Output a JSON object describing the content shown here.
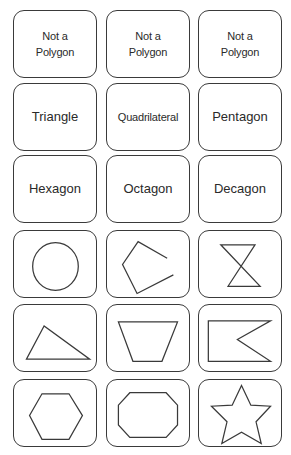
{
  "layout": {
    "columns_x": [
      13,
      106,
      198
    ],
    "rows_y": [
      10,
      83,
      155,
      230,
      304,
      379
    ],
    "card_width": 84,
    "card_height": 68
  },
  "colors": {
    "border": "#3a3a3a",
    "text": "#2a2a2a",
    "background": "#ffffff"
  },
  "name_cards": [
    {
      "id": "not-polygon-1",
      "label": "Not a\nPolygon"
    },
    {
      "id": "not-polygon-2",
      "label": "Not a\nPolygon"
    },
    {
      "id": "not-polygon-3",
      "label": "Not a\nPolygon"
    },
    {
      "id": "triangle",
      "label": "Triangle"
    },
    {
      "id": "quadrilateral",
      "label": "Quadrilateral"
    },
    {
      "id": "pentagon",
      "label": "Pentagon"
    },
    {
      "id": "hexagon",
      "label": "Hexagon"
    },
    {
      "id": "octagon",
      "label": "Octagon"
    },
    {
      "id": "decagon",
      "label": "Decagon"
    }
  ],
  "shape_cards": [
    {
      "id": "circle",
      "kind": "ellipse",
      "cx": 40,
      "cy": 34,
      "rx": 22,
      "ry": 23
    },
    {
      "id": "open-pentagon",
      "kind": "polyline",
      "points": "58,26 30,10 15,32 29,60 64,42"
    },
    {
      "id": "hourglass",
      "kind": "polygon",
      "points": "21,13 54,13 28,53 59,53"
    },
    {
      "id": "triangle-shape",
      "kind": "polygon",
      "points": "29,20 12,52 73,52"
    },
    {
      "id": "trapezoid-shape",
      "kind": "polygon",
      "points": "11,16 68,16 53,54 25,54"
    },
    {
      "id": "flag-shape",
      "kind": "polygon",
      "points": "9,15 69,15 37,33 69,54 9,54"
    },
    {
      "id": "hexagon-shape",
      "kind": "polygon",
      "points": "27,13 53,13 66,34 53,57 27,57 15,34"
    },
    {
      "id": "octagon-shape",
      "kind": "polygon",
      "points": "22,12 57,12 68,24 68,43 57,55 22,55 11,43 11,24"
    },
    {
      "id": "star-shape",
      "kind": "polygon",
      "points": "41,5 50,24 69,25 55,40 60,61 41,50 22,61 27,40 12,25 32,24"
    }
  ]
}
